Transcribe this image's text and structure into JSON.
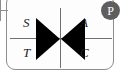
{
  "component": {
    "name": "triac-symbol",
    "type": "bidirectional-thyristor",
    "frame_color": "#8d8d8d",
    "lead_color": "#6f6f6f",
    "symbol_fill": "#000000"
  },
  "terminals": {
    "top_left": "S",
    "top_right": "A",
    "bottom_left": "T",
    "bottom_right": "C"
  },
  "badge": {
    "label": "P",
    "background": "#5e5e5e",
    "text_color": "#ffffff"
  },
  "icons": {
    "left_triangle": "triangle-right-icon",
    "right_triangle": "triangle-left-icon",
    "lead_stub": "wire-stub-icon"
  }
}
